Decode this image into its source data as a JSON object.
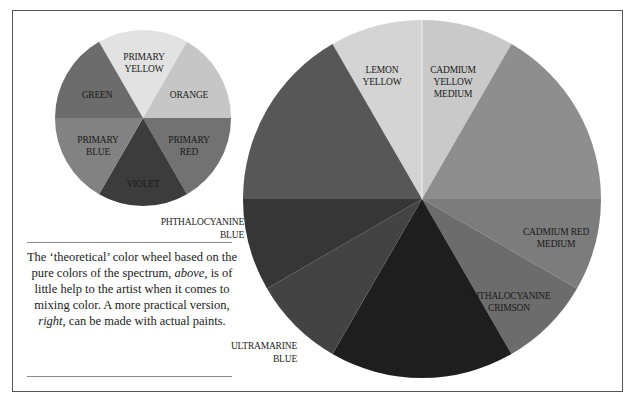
{
  "small_wheel": {
    "title": "theoretical color wheel",
    "segments": [
      {
        "name": "PRIMARY YELLOW",
        "line1": "PRIMARY",
        "line2": "YELLOW",
        "color": "#e2e2e2"
      },
      {
        "name": "ORANGE",
        "line1": "ORANGE",
        "line2": "",
        "color": "#c6c6c6"
      },
      {
        "name": "PRIMARY RED",
        "line1": "PRIMARY",
        "line2": "RED",
        "color": "#727272"
      },
      {
        "name": "VIOLET",
        "line1": "VIOLET",
        "line2": "",
        "color": "#3c3c3c"
      },
      {
        "name": "PRIMARY BLUE",
        "line1": "PRIMARY",
        "line2": "BLUE",
        "color": "#828282"
      },
      {
        "name": "GREEN",
        "line1": "GREEN",
        "line2": "",
        "color": "#6c6c6c"
      }
    ]
  },
  "large_wheel": {
    "title": "practical color wheel made with actual paints",
    "segments": [
      {
        "name": "LEMON YELLOW",
        "line1": "LEMON",
        "line2": "YELLOW",
        "line3": "",
        "color": "#d4d4d4"
      },
      {
        "name": "CADMIUM YELLOW MEDIUM",
        "line1": "CADMIUM",
        "line2": "YELLOW",
        "line3": "MEDIUM",
        "color": "#c9c9c9"
      },
      {
        "name": "unlabeled upper right",
        "color": "#8e8e8e"
      },
      {
        "name": "CADMIUM RED MEDIUM",
        "line1": "CADMIUM RED",
        "line2": "MEDIUM",
        "color": "#7c7c7c"
      },
      {
        "name": "PHTHALOCYANINE CRIMSON",
        "line1": "PHTHALOCYANINE",
        "line2": "CRIMSON",
        "color": "#6c6c6c"
      },
      {
        "name": "unlabeled bottom",
        "color": "#1e1e1e"
      },
      {
        "name": "ULTRAMARINE BLUE",
        "color": "#434343"
      },
      {
        "name": "PHTHALOCYANINE BLUE",
        "color": "#363636"
      },
      {
        "name": "unlabeled upper left",
        "color": "#575757"
      }
    ],
    "external_labels": {
      "phthalocyanine_blue": {
        "line1": "PHTHALOCYANINE",
        "line2": "BLUE"
      },
      "ultramarine_blue": {
        "line1": "ULTRAMARINE",
        "line2": "BLUE"
      }
    }
  },
  "caption": {
    "part1": "The ‘theoretical’ color wheel based on the pure colors of the spectrum, ",
    "above": "above",
    "part2": ", is of little help to the artist when it comes to mixing color. A more practical version, ",
    "right": "right",
    "part3": ", can be made with actual paints."
  }
}
